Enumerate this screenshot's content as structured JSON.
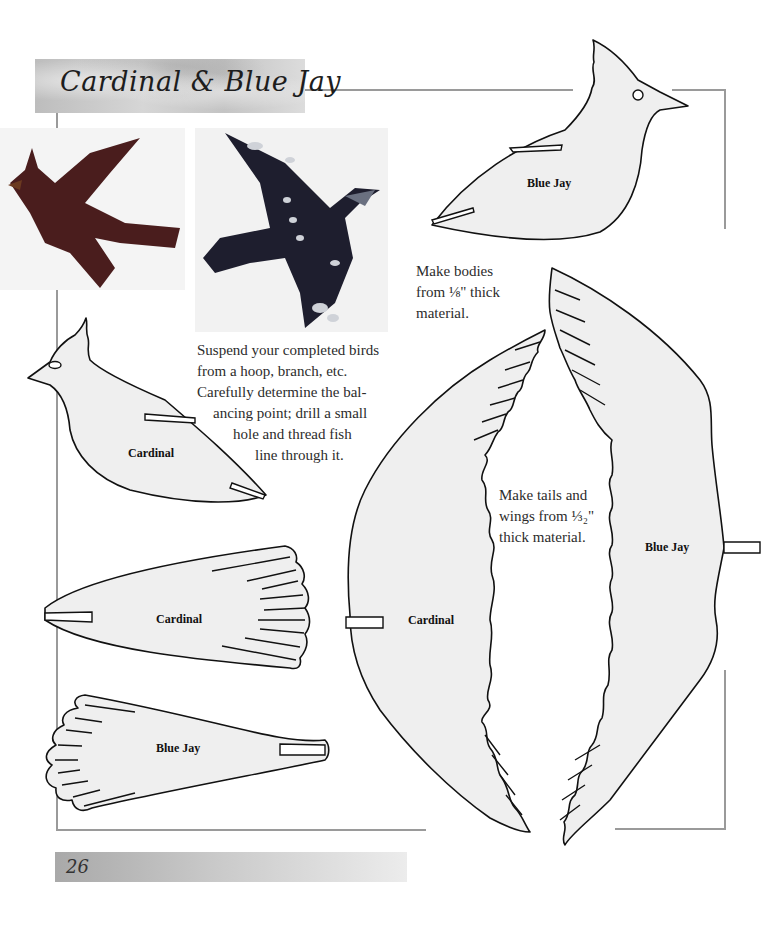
{
  "page": {
    "title": "Cardinal & Blue Jay",
    "page_number": "26"
  },
  "photos": [
    {
      "subject": "cardinal-model-photo"
    },
    {
      "subject": "blue-jay-model-photo"
    }
  ],
  "instructions": {
    "suspend": [
      "Suspend your completed birds",
      "from a hoop, branch, etc.",
      "Carefully determine the bal-",
      "ancing point; drill a small",
      "hole and thread fish",
      "line through it."
    ],
    "bodies": [
      "Make bodies",
      "from ⅛\" thick",
      "material."
    ],
    "tails_wings": [
      "Make tails and",
      "wings from ⅓₂\"",
      "thick material."
    ]
  },
  "patterns": {
    "blue_jay_body": "Blue Jay",
    "cardinal_body": "Cardinal",
    "cardinal_tail": "Cardinal",
    "blue_jay_tail": "Blue Jay",
    "cardinal_wing": "Cardinal",
    "blue_jay_wing": "Blue Jay"
  },
  "colors": {
    "frame": "#9a9a9a",
    "pattern_fill": "#efefef",
    "cardinal_photo": "#4a1d1d",
    "blue_jay_photo": "#1e1e2e"
  }
}
